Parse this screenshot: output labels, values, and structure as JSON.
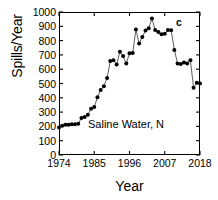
{
  "chart_data": {
    "type": "line",
    "title": "",
    "panel_label": "c",
    "annotation": "Saline Water, N",
    "xlabel": "Year",
    "ylabel": "Spills/Year",
    "xlim": [
      1974,
      2018
    ],
    "ylim": [
      0,
      1000
    ],
    "ytick_values": [
      0,
      100,
      200,
      300,
      400,
      500,
      600,
      700,
      800,
      900,
      1000
    ],
    "ytick_labels": [
      "0",
      "100",
      "200",
      "300",
      "400",
      "500",
      "600",
      "700",
      "800",
      "900",
      "1000"
    ],
    "xtick_values": [
      1974,
      1985,
      1996,
      2007,
      2018
    ],
    "xtick_labels": [
      "1974",
      "1985",
      "1996",
      "2007",
      "2018"
    ],
    "grid": false,
    "legend": false,
    "marker": "filled-circle",
    "marker_color": "#000000",
    "line_color": "#4d4d4d",
    "x": [
      1974,
      1975,
      1976,
      1977,
      1978,
      1979,
      1980,
      1981,
      1982,
      1983,
      1984,
      1985,
      1986,
      1987,
      1988,
      1989,
      1990,
      1991,
      1992,
      1993,
      1994,
      1995,
      1996,
      1997,
      1998,
      1999,
      2000,
      2001,
      2002,
      2003,
      2004,
      2005,
      2006,
      2007,
      2008,
      2009,
      2010,
      2011,
      2012,
      2013,
      2014,
      2015,
      2016,
      2017,
      2018
    ],
    "values": [
      193,
      205,
      212,
      212,
      215,
      215,
      219,
      258,
      265,
      281,
      323,
      336,
      403,
      454,
      480,
      538,
      658,
      663,
      632,
      722,
      692,
      640,
      712,
      713,
      878,
      780,
      826,
      870,
      886,
      954,
      875,
      860,
      845,
      848,
      875,
      872,
      735,
      640,
      636,
      646,
      640,
      662,
      470,
      505,
      500
    ]
  }
}
